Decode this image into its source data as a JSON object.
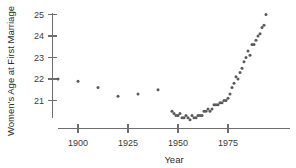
{
  "chart_data": {
    "type": "scatter",
    "title": "",
    "xlabel": "Year",
    "ylabel": "Women's Age at First Marriage",
    "xlim": [
      1890,
      1992
    ],
    "ylim": [
      20.1,
      25.2
    ],
    "grid": false,
    "legend": false,
    "xticks": [
      1900,
      1925,
      1950,
      1975
    ],
    "xticklabels": [
      "1900",
      "1925",
      "1950",
      "1975"
    ],
    "yticks": [
      21,
      22,
      23,
      24,
      25
    ],
    "yticklabels": [
      "21",
      "22",
      "23",
      "24",
      "25"
    ],
    "marker_color": "#5a5a5a",
    "axis_color": "#6e6e6e",
    "x": [
      1890,
      1900,
      1910,
      1920,
      1930,
      1940,
      1947,
      1948,
      1949,
      1950,
      1951,
      1952,
      1953,
      1954,
      1955,
      1956,
      1957,
      1958,
      1959,
      1960,
      1961,
      1962,
      1963,
      1964,
      1965,
      1966,
      1967,
      1968,
      1969,
      1970,
      1971,
      1972,
      1973,
      1974,
      1975,
      1976,
      1977,
      1978,
      1979,
      1980,
      1981,
      1982,
      1983,
      1984,
      1985,
      1986,
      1987,
      1988,
      1989,
      1990
    ],
    "y": [
      22.0,
      21.9,
      21.6,
      21.2,
      21.3,
      21.5,
      20.5,
      20.4,
      20.3,
      20.3,
      20.4,
      20.2,
      20.2,
      20.3,
      20.2,
      20.1,
      20.3,
      20.2,
      20.2,
      20.3,
      20.3,
      20.3,
      20.5,
      20.5,
      20.6,
      20.5,
      20.6,
      20.8,
      20.8,
      20.8,
      20.9,
      20.9,
      21.0,
      21.0,
      21.1,
      21.3,
      21.6,
      21.8,
      22.1,
      22.0,
      22.3,
      22.5,
      22.8,
      23.0,
      23.3,
      23.1,
      23.6,
      23.6,
      23.8,
      24.0
    ],
    "x_extra": [
      1991,
      1992,
      1993,
      1994
    ],
    "y_extra": [
      24.1,
      24.4,
      24.5,
      25.0
    ],
    "points_label": "Median age at first marriage, women"
  }
}
